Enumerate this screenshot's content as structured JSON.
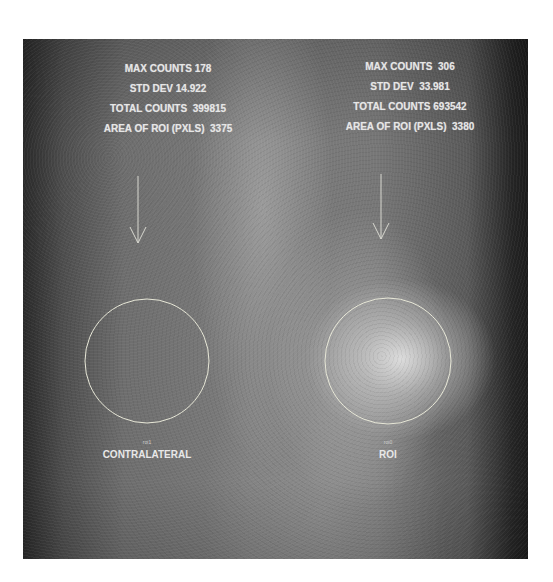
{
  "image": {
    "description": "Grayscale scintigraphy scan with two circular regions of interest and statistics overlay",
    "colors": {
      "overlay_text": "#e6e6e6",
      "roi_outline": "#e8e8d8",
      "page_background": "#ffffff"
    }
  },
  "left_panel": {
    "stats": {
      "max_counts": "MAX COUNTS 178",
      "std_dev": "STD DEV 14.922",
      "total_counts": "TOTAL COUNTS  399815",
      "area": "AREA OF ROI (PXLS)  3375"
    },
    "roi_tag": "roi1",
    "caption": "CONTRALATERAL"
  },
  "right_panel": {
    "stats": {
      "max_counts": "MAX COUNTS  306",
      "std_dev": "STD DEV  33.981",
      "total_counts": "TOTAL COUNTS 693542",
      "area": "AREA OF ROI (PXLS)  3380"
    },
    "roi_tag": "roi0",
    "caption": "ROI"
  }
}
